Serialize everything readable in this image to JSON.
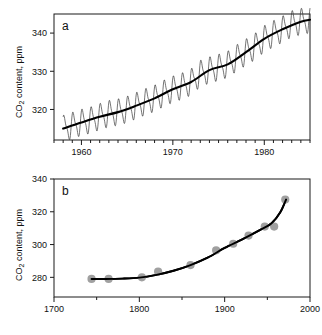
{
  "figure": {
    "panel_a_letter": "a",
    "panel_b_letter": "b",
    "y_axis_label_main": "CO",
    "y_axis_label_sub": "2",
    "y_axis_label_rest": " content, ppm"
  },
  "chart_data": [
    {
      "type": "line",
      "panel": "a",
      "title": "",
      "xlabel": "",
      "ylabel": "CO2 content, ppm",
      "xlim": [
        1957.0,
        1985.0
      ],
      "ylim": [
        312.0,
        345.0
      ],
      "grid": false,
      "legend": null,
      "xticks_major": [
        1960,
        1970,
        1980
      ],
      "xticklabels": [
        "1960",
        "1970",
        "1980"
      ],
      "xtick_minor_step": 1,
      "yticks": [
        320,
        330,
        340
      ],
      "yticklabels": [
        "320",
        "330",
        "340"
      ],
      "series": [
        {
          "name": "Monthly CO2 with seasonal cycle",
          "style": "thin-oscillating",
          "description": "Keeling curve monthly record showing annual sawtooth oscillation of roughly 6 ppm peak-to-peak superimposed on rising trend",
          "seasonal_amplitude_ppm": 3.0,
          "x": [
            1958.0,
            1959.0,
            1960.0,
            1961.0,
            1962.0,
            1963.0,
            1964.0,
            1965.0,
            1966.0,
            1967.0,
            1968.0,
            1969.0,
            1970.0,
            1971.0,
            1972.0,
            1973.0,
            1974.0,
            1975.0,
            1976.0,
            1977.0,
            1978.0,
            1979.0,
            1980.0,
            1981.0,
            1982.0,
            1983.0,
            1984.0,
            1985.0
          ],
          "values": [
            315.0,
            315.8,
            316.6,
            317.2,
            318.1,
            318.9,
            319.3,
            320.0,
            321.0,
            322.0,
            322.9,
            324.2,
            325.3,
            326.1,
            327.2,
            329.4,
            330.3,
            331.0,
            331.8,
            333.5,
            335.0,
            336.5,
            338.5,
            339.8,
            341.0,
            342.4,
            343.0,
            343.5
          ]
        },
        {
          "name": "Annual mean trend",
          "style": "thick-black",
          "x": [
            1958.0,
            1960.0,
            1962.0,
            1964.0,
            1966.0,
            1968.0,
            1970.0,
            1972.0,
            1974.0,
            1976.0,
            1978.0,
            1980.0,
            1982.0,
            1984.0,
            1985.0
          ],
          "values": [
            315.0,
            316.6,
            318.1,
            319.3,
            321.0,
            322.9,
            325.3,
            327.2,
            330.3,
            331.8,
            335.0,
            338.5,
            341.0,
            343.0,
            343.5
          ]
        }
      ]
    },
    {
      "type": "line",
      "panel": "b",
      "title": "",
      "xlabel": "",
      "ylabel": "CO2 content, ppm",
      "xlim": [
        1700,
        2000
      ],
      "ylim": [
        268,
        340
      ],
      "grid": false,
      "legend": null,
      "xticks_major": [
        1700,
        1800,
        1900,
        2000
      ],
      "xticklabels": [
        "1700",
        "1800",
        "1900",
        "2000"
      ],
      "xtick_minor_step": 50,
      "yticks": [
        280,
        300,
        320,
        340
      ],
      "yticklabels": [
        "280",
        "300",
        "320",
        "340"
      ],
      "series": [
        {
          "name": "Ice core CO2 measurements",
          "style": "gray-circle-markers",
          "marker_color": "#a0a0a0",
          "x": [
            1744,
            1764,
            1803,
            1822,
            1860,
            1890,
            1910,
            1928,
            1947,
            1958,
            1971
          ],
          "values": [
            279,
            279,
            280,
            283.5,
            287.5,
            296.5,
            300.5,
            305.5,
            311,
            311,
            327.5
          ]
        },
        {
          "name": "Fitted trend curve",
          "style": "thick-black",
          "x": [
            1744,
            1760,
            1780,
            1800,
            1820,
            1840,
            1860,
            1880,
            1900,
            1920,
            1940,
            1955,
            1965,
            1972
          ],
          "values": [
            279,
            279,
            279.2,
            279.8,
            281.5,
            284,
            287.5,
            292,
            298,
            303,
            308.5,
            313,
            319.5,
            327.5
          ]
        }
      ]
    }
  ]
}
